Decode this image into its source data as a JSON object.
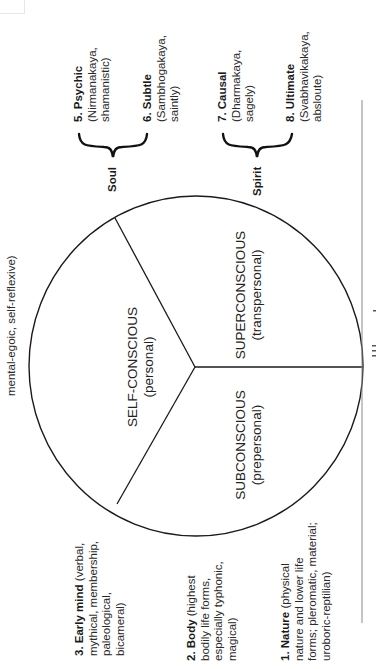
{
  "figure": {
    "orientation": "rotated-90-ccw",
    "segments": [
      {
        "title": "SELF-CONSCIOUS",
        "subtitle": "(personal)"
      },
      {
        "title": "SUPERCONSCIOUS",
        "subtitle": "(transpersonal)"
      },
      {
        "title": "SUBCONSCIOUS",
        "subtitle": "(prepersonal)"
      }
    ],
    "brackets": [
      {
        "label": "Soul",
        "covers": [
          "5",
          "6"
        ]
      },
      {
        "label": "Spirit",
        "covers": [
          "7",
          "8"
        ]
      }
    ],
    "levels": [
      {
        "num": "1.",
        "name": "Nature",
        "lines": [
          "(physical",
          "nature and lower life",
          "forms; pleromatic, material;",
          "uroboric-reptilian)"
        ]
      },
      {
        "num": "2.",
        "name": "Body",
        "lines": [
          "(highest",
          "bodily life forms,",
          "especially typhonic,",
          "magical)"
        ]
      },
      {
        "num": "3.",
        "name": "Early mind",
        "lines": [
          "(verbal,",
          "mythical, membership,",
          "paleological,",
          "bicameral)"
        ]
      },
      {
        "num": "4.",
        "name": "",
        "lines": [
          "mental-egoic, self-reflexive)"
        ]
      },
      {
        "num": "5.",
        "name": "Psychic",
        "lines": [
          "(Nirmanakaya,",
          "shamanistic)"
        ]
      },
      {
        "num": "6.",
        "name": "Subtle",
        "lines": [
          "(Sambhogakaya,",
          "saintly)"
        ]
      },
      {
        "num": "7.",
        "name": "Causal",
        "lines": [
          "(Dharmakaya,",
          "sagely)"
        ]
      },
      {
        "num": "8.",
        "name": "Ultimate",
        "lines": [
          "(Svabhavikakaya,",
          "absloute)"
        ]
      }
    ],
    "caption_partial": "The Great Holarchy"
  },
  "colors": {
    "ink": "#1a1a1a",
    "text": "#2a2a2a",
    "rule": "#8a8a8a",
    "background": "#ffffff"
  }
}
